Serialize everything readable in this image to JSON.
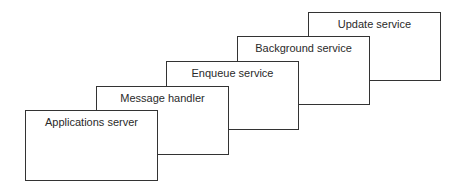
{
  "diagram": {
    "type": "stacked-layers",
    "boxes": [
      {
        "label": "Update service",
        "x": 308,
        "y": 12
      },
      {
        "label": "Background service",
        "x": 237,
        "y": 36
      },
      {
        "label": "Enqueue service",
        "x": 166,
        "y": 61
      },
      {
        "label": "Message handler",
        "x": 96,
        "y": 86
      },
      {
        "label": "Applications server",
        "x": 25,
        "y": 110
      }
    ]
  }
}
